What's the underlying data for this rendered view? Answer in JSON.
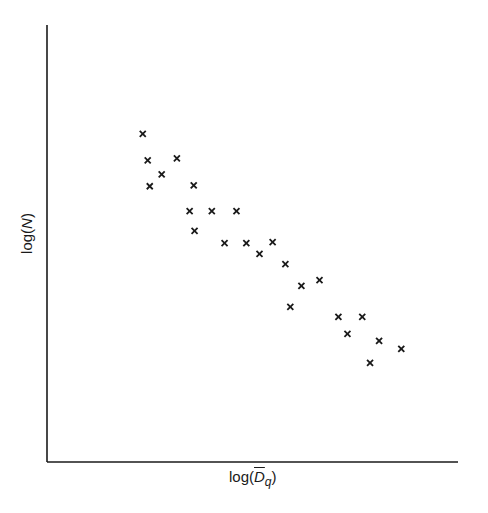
{
  "chart_data": {
    "type": "scatter",
    "title": "",
    "xlabel": "log(D̄_q)",
    "ylabel": "log(N)",
    "marker": "x",
    "grid": false,
    "legend": null,
    "xlim": [
      0,
      1
    ],
    "ylim": [
      0,
      1
    ],
    "ticks": "none",
    "points": [
      {
        "x": 0.233,
        "y": 0.751
      },
      {
        "x": 0.245,
        "y": 0.69
      },
      {
        "x": 0.316,
        "y": 0.695
      },
      {
        "x": 0.279,
        "y": 0.658
      },
      {
        "x": 0.25,
        "y": 0.631
      },
      {
        "x": 0.357,
        "y": 0.633
      },
      {
        "x": 0.347,
        "y": 0.574
      },
      {
        "x": 0.401,
        "y": 0.574
      },
      {
        "x": 0.461,
        "y": 0.574
      },
      {
        "x": 0.359,
        "y": 0.529
      },
      {
        "x": 0.432,
        "y": 0.501
      },
      {
        "x": 0.485,
        "y": 0.501
      },
      {
        "x": 0.549,
        "y": 0.503
      },
      {
        "x": 0.517,
        "y": 0.476
      },
      {
        "x": 0.58,
        "y": 0.453
      },
      {
        "x": 0.663,
        "y": 0.416
      },
      {
        "x": 0.619,
        "y": 0.403
      },
      {
        "x": 0.592,
        "y": 0.355
      },
      {
        "x": 0.709,
        "y": 0.332
      },
      {
        "x": 0.767,
        "y": 0.332
      },
      {
        "x": 0.731,
        "y": 0.293
      },
      {
        "x": 0.808,
        "y": 0.277
      },
      {
        "x": 0.862,
        "y": 0.259
      },
      {
        "x": 0.786,
        "y": 0.227
      }
    ]
  },
  "axes": {
    "x_label_prefix": "log(",
    "x_label_symbol": "D",
    "x_label_subscript": "q",
    "x_label_suffix": ")",
    "y_label_prefix": "log(",
    "y_label_symbol": "N",
    "y_label_suffix": ")",
    "color": "#1a1a1a"
  }
}
